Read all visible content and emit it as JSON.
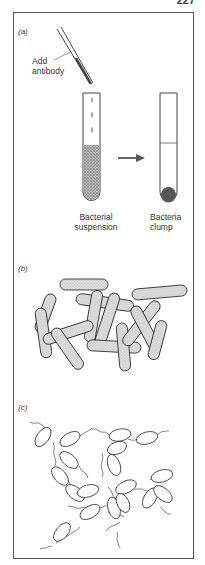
{
  "page_number": "227",
  "panels": [
    {
      "label": "(a)",
      "annotations": {
        "pipette": "Add antibody",
        "pipette_line1": "Add",
        "pipette_line2": "antibody",
        "left_tube_line1": "Bacterial",
        "left_tube_line2": "suspension",
        "right_tube_line1": "Bacteria",
        "right_tube_line2": "clump"
      }
    },
    {
      "label": "(b)",
      "description": "Rod-shaped bacteria cross-linked by antibody"
    },
    {
      "label": "(c)",
      "description": "Flagellated bacteria chains linked via flagella"
    }
  ],
  "colors": {
    "line": "#333333",
    "stipple": "#8a8a8a",
    "pellet": "#555555"
  }
}
